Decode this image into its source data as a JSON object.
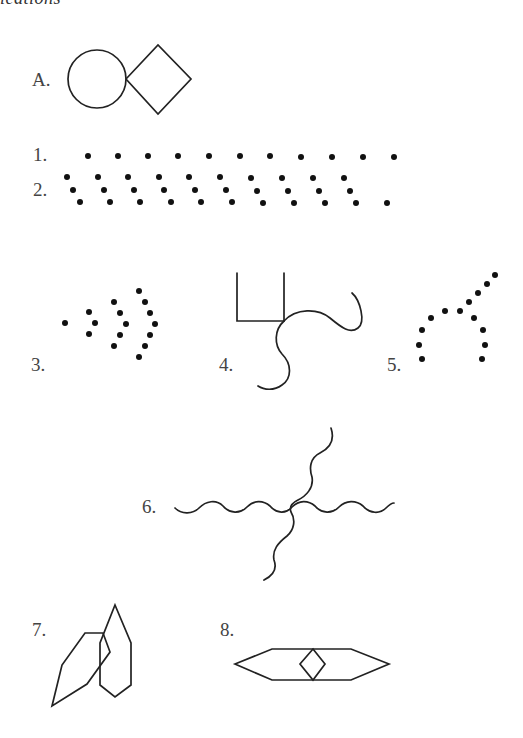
{
  "header": {
    "fragment": "ications"
  },
  "example": {
    "label": "A.",
    "shapes": [
      "circle",
      "diamond"
    ]
  },
  "items": [
    {
      "id": 1,
      "label": "1.",
      "type": "dot-row"
    },
    {
      "id": 2,
      "label": "2.",
      "type": "dot-diagonal-groups"
    },
    {
      "id": 3,
      "label": "3.",
      "type": "dot-chevrons"
    },
    {
      "id": 4,
      "label": "4.",
      "type": "square-bracket-with-waves"
    },
    {
      "id": 5,
      "label": "5.",
      "type": "dot-branch"
    },
    {
      "id": 6,
      "label": "6.",
      "type": "crossing-wavy-lines"
    },
    {
      "id": 7,
      "label": "7.",
      "type": "overlapping-polygons"
    },
    {
      "id": 8,
      "label": "8.",
      "type": "hexagon-with-diamond"
    }
  ],
  "colors": {
    "stroke": "#222222",
    "dot": "#111111",
    "label": "#444444",
    "background": "#ffffff"
  }
}
